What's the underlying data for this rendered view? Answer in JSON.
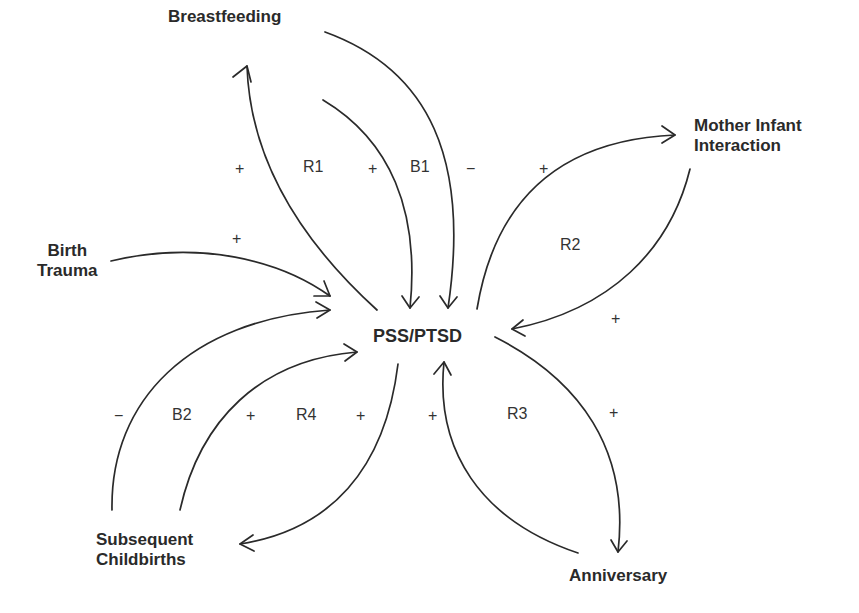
{
  "diagram": {
    "type": "causal-loop-diagram",
    "nodes": {
      "center": "PSS/PTSD",
      "breastfeeding": "Breastfeeding",
      "mother_infant_line1": "Mother Infant",
      "mother_infant_line2": "Interaction",
      "birth_trauma_line1": "Birth",
      "birth_trauma_line2": "Trauma",
      "subsequent_line1": "Subsequent",
      "subsequent_line2": "Childbirths",
      "anniversary": "Anniversary"
    },
    "loops": {
      "r1": "R1",
      "b1": "B1",
      "r2": "R2",
      "b2": "B2",
      "r4": "R4",
      "r3": "R3"
    },
    "polarities": {
      "pss_to_breastfeeding": "+",
      "breastfeeding_to_pss_inner": "+",
      "breastfeeding_to_pss_outer": "−",
      "pss_to_mother_infant": "+",
      "mother_infant_to_pss": "+",
      "birth_trauma_to_pss": "+",
      "subsequent_to_pss_outer": "−",
      "subsequent_to_pss_inner": "+",
      "pss_to_subsequent": "+",
      "anniversary_to_pss": "+",
      "pss_to_anniversary": "+"
    },
    "edges": [
      {
        "from": "PSS/PTSD",
        "to": "Breastfeeding",
        "polarity": "+"
      },
      {
        "from": "Breastfeeding",
        "to": "PSS/PTSD",
        "polarity": "+"
      },
      {
        "from": "Breastfeeding",
        "to": "PSS/PTSD",
        "polarity": "−"
      },
      {
        "from": "PSS/PTSD",
        "to": "Mother Infant Interaction",
        "polarity": "+"
      },
      {
        "from": "Mother Infant Interaction",
        "to": "PSS/PTSD",
        "polarity": "+"
      },
      {
        "from": "Birth Trauma",
        "to": "PSS/PTSD",
        "polarity": "+"
      },
      {
        "from": "Subsequent Childbirths",
        "to": "PSS/PTSD",
        "polarity": "−"
      },
      {
        "from": "Subsequent Childbirths",
        "to": "PSS/PTSD",
        "polarity": "+"
      },
      {
        "from": "PSS/PTSD",
        "to": "Subsequent Childbirths",
        "polarity": "+"
      },
      {
        "from": "Anniversary",
        "to": "PSS/PTSD",
        "polarity": "+"
      },
      {
        "from": "PSS/PTSD",
        "to": "Anniversary",
        "polarity": "+"
      }
    ]
  }
}
